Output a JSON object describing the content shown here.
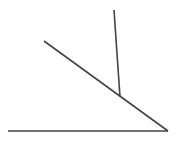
{
  "figure": {
    "canvas": {
      "width": 179,
      "height": 142,
      "background_color": "#ffffff"
    },
    "style": {
      "stroke_color": "#444444",
      "stroke_width": 1.6
    },
    "vertex": {
      "label": "vertex",
      "x": 168,
      "y": 131
    },
    "segments": [
      {
        "name": "horizontal-ray",
        "label": "Horizontal ray",
        "x1": 8,
        "y1": 131,
        "x2": 168,
        "y2": 131,
        "stroke_color": "#444444",
        "stroke_width": 1.6
      },
      {
        "name": "diagonal-ray",
        "label": "Diagonal ray",
        "x1": 44,
        "y1": 41,
        "x2": 168,
        "y2": 131,
        "stroke_color": "#444444",
        "stroke_width": 1.6
      },
      {
        "name": "vertical-segment",
        "label": "Vertical segment",
        "x1": 114,
        "y1": 10,
        "x2": 120,
        "y2": 97,
        "stroke_color": "#444444",
        "stroke_width": 1.6
      }
    ],
    "intersection": {
      "name": "vertical-meets-diagonal",
      "label": "Intersection point",
      "x": 120,
      "y": 97
    }
  }
}
